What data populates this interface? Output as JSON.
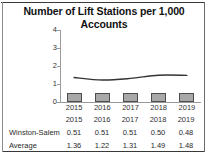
{
  "chart_data": {
    "type": "bar",
    "title": "Number of Lift Stations per 1,000 Accounts",
    "title_line1": "Number of Lift Stations per 1,000",
    "title_line2": "Accounts",
    "xlabel": "",
    "ylabel": "",
    "categories": [
      "2015",
      "2016",
      "2017",
      "2018",
      "2019"
    ],
    "ylim": [
      0,
      4
    ],
    "yticks": [
      "4",
      "3",
      "2",
      "1",
      "0"
    ],
    "ytick_values": [
      4,
      3,
      2,
      1,
      0
    ],
    "grid": false,
    "legend_position": "none",
    "series": [
      {
        "name": "Winston-Salem",
        "render": "bar",
        "color": "#a8a8a8",
        "border_color": "#4d4d4d",
        "values": [
          0.51,
          0.51,
          0.51,
          0.5,
          0.48
        ],
        "labels": [
          "0.51",
          "0.51",
          "0.51",
          "0.50",
          "0.48"
        ]
      },
      {
        "name": "Average",
        "render": "line",
        "color": "#333333",
        "values": [
          1.36,
          1.22,
          1.31,
          1.49,
          1.48
        ],
        "labels": [
          "1.36",
          "1.22",
          "1.31",
          "1.49",
          "1.48"
        ]
      }
    ],
    "table": {
      "header": [
        "",
        "2015",
        "2016",
        "2017",
        "2018",
        "2019"
      ],
      "rows": [
        {
          "label": "Winston-Salem",
          "values": [
            "0.51",
            "0.51",
            "0.51",
            "0.50",
            "0.48"
          ]
        },
        {
          "label": "Average",
          "values": [
            "1.36",
            "1.22",
            "1.31",
            "1.49",
            "1.48"
          ]
        }
      ]
    }
  },
  "colors": {
    "bar_fill": "#a8a8a8",
    "bar_border": "#4d4d4d",
    "line": "#333333",
    "axis": "#9a9a9a",
    "text": "#2a2a2a",
    "frame": "#3a3a3a",
    "background": "#ffffff"
  }
}
